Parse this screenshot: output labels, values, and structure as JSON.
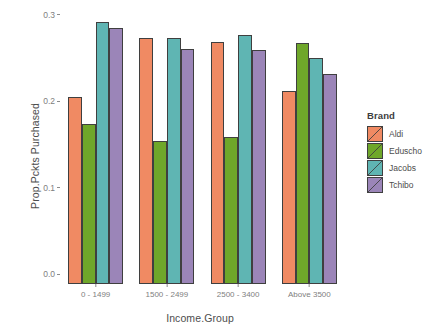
{
  "chart_data": {
    "type": "bar",
    "title": "",
    "xlabel": "Income.Group",
    "ylabel": "Prop.Pckts Purchased",
    "categories": [
      "0 - 1499",
      "1500 - 2499",
      "2500 - 3400",
      "Above 3500"
    ],
    "series": [
      {
        "name": "Aldi",
        "color": "#F08A63",
        "values": [
          0.216,
          0.284,
          0.28,
          0.223
        ]
      },
      {
        "name": "Eduscho",
        "color": "#6FA72A",
        "values": [
          0.185,
          0.165,
          0.17,
          0.279
        ]
      },
      {
        "name": "Jacobs",
        "color": "#5FB5B3",
        "values": [
          0.303,
          0.284,
          0.288,
          0.262
        ]
      },
      {
        "name": "Tchibo",
        "color": "#9B85B8",
        "values": [
          0.296,
          0.272,
          0.271,
          0.243
        ]
      }
    ],
    "ylim": [
      0.0,
      0.31
    ],
    "yticks": [
      0.0,
      0.1,
      0.2,
      0.3
    ],
    "ytick_labels": [
      "0.0",
      "0.1",
      "0.2",
      "0.3"
    ],
    "grid": false,
    "legend_position": "right",
    "legend_title": "Brand",
    "bar_border_color": "#3f3f3f",
    "axis_text_color": "#808080",
    "axis_title_color": "#4d4d4d",
    "panel_background": "#ffffff"
  },
  "legend": {
    "title": "Brand",
    "items": [
      {
        "label": "Aldi",
        "color": "#F08A63"
      },
      {
        "label": "Eduscho",
        "color": "#6FA72A"
      },
      {
        "label": "Jacobs",
        "color": "#5FB5B3"
      },
      {
        "label": "Tchibo",
        "color": "#9B85B8"
      }
    ]
  },
  "axes": {
    "y_title": "Prop.Pckts Purchased",
    "x_title": "Income.Group"
  }
}
